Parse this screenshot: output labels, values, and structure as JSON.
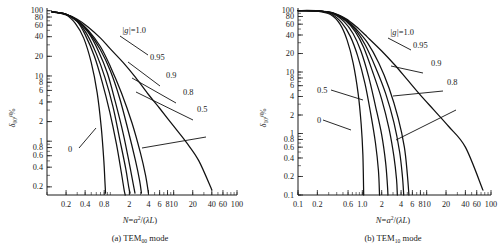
{
  "figure": {
    "panels": [
      {
        "id": "a",
        "caption_prefix": "(a)",
        "caption_mode": "TEM",
        "caption_sub": "00",
        "caption_suffix": "mode",
        "y_axis_symbol": "δ",
        "y_axis_sub": "00",
        "y_axis_unit": "/%",
        "x_axis_title": "N=a²/(λL)"
      },
      {
        "id": "b",
        "caption_prefix": "(b)",
        "caption_mode": "TEM",
        "caption_sub": "10",
        "caption_suffix": "mode",
        "y_axis_symbol": "δ",
        "y_axis_sub": "10",
        "y_axis_unit": "/%",
        "x_axis_title": "N=a²/(λL)"
      }
    ]
  },
  "chart_data": [
    {
      "type": "line",
      "panel": "a",
      "title": "(a) TEM00 mode",
      "xlabel": "N=a²/(λL)",
      "ylabel": "δ00/%",
      "xscale": "log",
      "yscale": "log",
      "xlim": [
        0.1,
        100
      ],
      "ylim": [
        0.15,
        110
      ],
      "grid": false,
      "legend_position": "inline-annotations",
      "x_ticks": [
        0.2,
        0.4,
        0.8,
        2,
        4,
        6,
        8,
        10,
        20,
        40,
        60,
        100
      ],
      "x_tick_labels": [
        "0.2",
        "0.4",
        "0.8",
        "2",
        "4",
        "6",
        "8",
        "10",
        "20",
        "40",
        "60",
        "100"
      ],
      "y_ticks": [
        100,
        80,
        60,
        40,
        20,
        10,
        8,
        6,
        4,
        2,
        1,
        0.8,
        0.6,
        0.4,
        0.2
      ],
      "y_tick_labels": [
        "100",
        "80",
        "60",
        "40",
        "20",
        "10",
        "8",
        "6",
        "4",
        "2",
        "1",
        "0.8",
        "0.6",
        "0.4",
        "0.2"
      ],
      "annotations": [
        "|g|=1.0",
        "0.95",
        "0.9",
        "0.8",
        "0.5",
        "0"
      ],
      "series": [
        {
          "name": "|g|=1.0",
          "label": "|g|=1.0",
          "x": [
            0.12,
            0.2,
            0.3,
            0.45,
            0.7,
            1.0,
            1.6,
            2.5,
            4.0,
            6.0,
            10.0,
            16.0,
            25.0,
            40.0
          ],
          "y": [
            96,
            88,
            74,
            56,
            38,
            26,
            16,
            9.5,
            5.2,
            3.2,
            1.7,
            0.95,
            0.5,
            0.18
          ]
        },
        {
          "name": "0.5",
          "label": "0.5",
          "x": [
            0.12,
            0.2,
            0.3,
            0.45,
            0.7,
            1.0,
            1.5,
            2.2,
            3.0,
            3.6,
            4.0
          ],
          "y": [
            96,
            88,
            72,
            50,
            28,
            14,
            5.5,
            1.9,
            0.65,
            0.3,
            0.16
          ]
        },
        {
          "name": "0.8",
          "label": "0.8",
          "x": [
            0.12,
            0.2,
            0.3,
            0.45,
            0.7,
            1.0,
            1.4,
            1.9,
            2.5,
            2.9,
            3.1
          ],
          "y": [
            96,
            88,
            71,
            48,
            25,
            12,
            4.6,
            1.5,
            0.5,
            0.25,
            0.16
          ]
        },
        {
          "name": "0.9",
          "label": "0.9",
          "x": [
            0.12,
            0.2,
            0.3,
            0.45,
            0.65,
            0.9,
            1.2,
            1.6,
            2.0,
            2.3,
            2.45
          ],
          "y": [
            96,
            88,
            70,
            46,
            24,
            11,
            4.0,
            1.3,
            0.45,
            0.22,
            0.16
          ]
        },
        {
          "name": "0.95",
          "label": "0.95",
          "x": [
            0.12,
            0.2,
            0.3,
            0.42,
            0.6,
            0.82,
            1.1,
            1.4,
            1.75,
            1.95,
            2.05
          ],
          "y": [
            96,
            88,
            69,
            45,
            22,
            9.5,
            3.4,
            1.1,
            0.38,
            0.2,
            0.16
          ]
        },
        {
          "name": "0.7",
          "label": "",
          "x": [
            0.12,
            0.2,
            0.3,
            0.4,
            0.56,
            0.74,
            0.98,
            1.25,
            1.5,
            1.65,
            1.72
          ],
          "y": [
            96,
            88,
            68,
            43,
            20,
            8.2,
            2.8,
            0.9,
            0.32,
            0.18,
            0.15
          ]
        },
        {
          "name": "0",
          "label": "0",
          "x": [
            0.12,
            0.2,
            0.28,
            0.38,
            0.5,
            0.62,
            0.72,
            0.79,
            0.82,
            0.84
          ],
          "y": [
            96,
            86,
            64,
            38,
            16,
            5.5,
            1.6,
            0.5,
            0.25,
            0.16
          ]
        }
      ]
    },
    {
      "type": "line",
      "panel": "b",
      "title": "(b) TEM10 mode",
      "xlabel": "N=a²/(λL)",
      "ylabel": "δ10/%",
      "xscale": "log",
      "yscale": "log",
      "xlim": [
        0.1,
        100
      ],
      "ylim": [
        0.1,
        110
      ],
      "grid": false,
      "legend_position": "inline-annotations",
      "x_ticks": [
        0.1,
        0.2,
        0.6,
        1.0,
        2,
        4,
        6,
        8,
        10,
        20,
        40,
        60,
        100
      ],
      "x_tick_labels": [
        "0.1",
        "0.2",
        "0.6",
        "1.0",
        "2",
        "4",
        "6",
        "8",
        "10",
        "20",
        "40",
        "60",
        "100"
      ],
      "y_ticks": [
        100,
        80,
        60,
        40,
        20,
        10,
        8,
        6,
        4,
        2,
        1,
        0.8,
        0.6,
        0.4,
        0.2,
        0.1
      ],
      "y_tick_labels": [
        "100",
        "80",
        "60",
        "40",
        "20",
        "10",
        "8",
        "6",
        "4",
        "2",
        "1",
        "0.8",
        "0.6",
        "0.4",
        "0.2",
        "0.1"
      ],
      "annotations": [
        "|g|=1.0",
        "0.95",
        "0.9",
        "0.8",
        "0.5",
        "0"
      ],
      "series": [
        {
          "name": "|g|=1.0",
          "label": "|g|=1.0",
          "x": [
            0.1,
            0.2,
            0.35,
            0.55,
            0.8,
            1.2,
            2.0,
            3.2,
            5.0,
            8.0,
            13.0,
            22.0,
            40.0,
            75.0
          ],
          "y": [
            100,
            99,
            92,
            74,
            55,
            37,
            22,
            13,
            7.5,
            4.2,
            2.4,
            1.3,
            0.6,
            0.12
          ]
        },
        {
          "name": "0.8",
          "label": "0.8",
          "x": [
            0.1,
            0.2,
            0.35,
            0.55,
            0.8,
            1.2,
            1.8,
            2.6,
            3.6,
            4.5,
            5.0,
            5.3
          ],
          "y": [
            100,
            99,
            91,
            72,
            50,
            30,
            14,
            5.5,
            1.8,
            0.6,
            0.22,
            0.1
          ]
        },
        {
          "name": "0.9",
          "label": "0.9",
          "x": [
            0.1,
            0.2,
            0.35,
            0.55,
            0.8,
            1.1,
            1.6,
            2.3,
            3.1,
            3.8,
            4.2,
            4.4
          ],
          "y": [
            100,
            99,
            90,
            70,
            47,
            28,
            12,
            4.5,
            1.5,
            0.5,
            0.2,
            0.1
          ]
        },
        {
          "name": "0.95",
          "label": "0.95",
          "x": [
            0.1,
            0.2,
            0.35,
            0.55,
            0.78,
            1.05,
            1.45,
            2.0,
            2.6,
            3.1,
            3.4,
            3.5
          ],
          "y": [
            100,
            99,
            90,
            68,
            45,
            25,
            10,
            3.6,
            1.2,
            0.42,
            0.18,
            0.1
          ]
        },
        {
          "name": "0.6",
          "label": "",
          "x": [
            0.1,
            0.2,
            0.35,
            0.52,
            0.72,
            0.95,
            1.25,
            1.6,
            2.0,
            2.3,
            2.45,
            2.5
          ],
          "y": [
            100,
            99,
            89,
            66,
            42,
            22,
            8.5,
            2.8,
            0.95,
            0.34,
            0.15,
            0.1
          ]
        },
        {
          "name": "0.5",
          "label": "0.5",
          "x": [
            0.1,
            0.2,
            0.33,
            0.48,
            0.65,
            0.85,
            1.1,
            1.35,
            1.6,
            1.78,
            1.85
          ],
          "y": [
            100,
            99,
            88,
            63,
            38,
            18,
            6.5,
            2.1,
            0.7,
            0.25,
            0.1
          ]
        },
        {
          "name": "0",
          "label": "0",
          "x": [
            0.1,
            0.2,
            0.32,
            0.45,
            0.58,
            0.72,
            0.86,
            0.96,
            1.02,
            1.05
          ],
          "y": [
            100,
            98,
            86,
            60,
            33,
            14,
            4.5,
            1.4,
            0.45,
            0.1
          ]
        }
      ]
    }
  ]
}
